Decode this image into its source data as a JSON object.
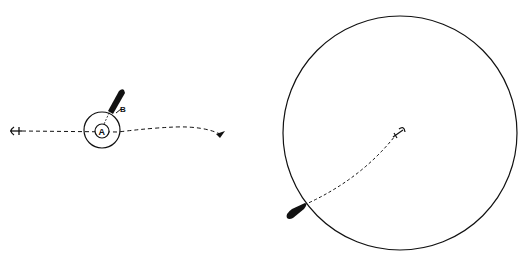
{
  "figure": {
    "left_panel": {
      "label_a": "A",
      "label_b": "B",
      "description": "Boat moored close to anchor A, swinging within small radius; drift line along dashed path"
    },
    "right_panel": {
      "description": "Large swing circle around anchor with boat at circumference, dashed rode to anchor"
    }
  },
  "colors": {
    "ink": "#111111",
    "background": "#ffffff"
  }
}
